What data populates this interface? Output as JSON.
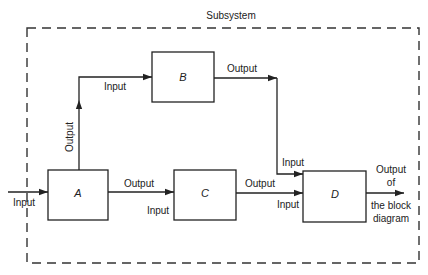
{
  "title": "Subsystem",
  "blocks": {
    "A": "A",
    "B": "B",
    "C": "C",
    "D": "D"
  },
  "labels": {
    "system_input": "Input",
    "a_output_up": "Output",
    "b_input": "Input",
    "b_output": "Output",
    "a_output_right": "Output",
    "c_input": "Input",
    "c_output": "Output",
    "d_input_top": "Input",
    "d_input_bottom": "Input",
    "final_output_line1": "Output",
    "final_output_line2": "of",
    "final_output_line3": "the block",
    "final_output_line4": "diagram"
  },
  "colors": {
    "line": "#222222",
    "background": "#ffffff"
  }
}
